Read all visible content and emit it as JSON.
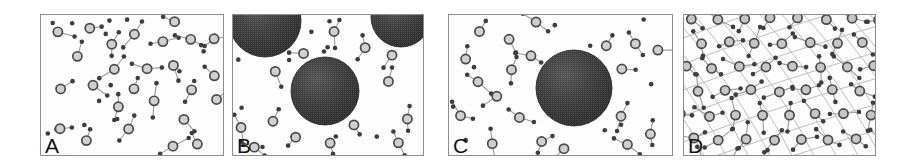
{
  "figure": {
    "type": "scientific-schematic",
    "background_color": "#ffffff",
    "frame_color": "#8d8d8d",
    "width": 907,
    "height": 164,
    "panels": [
      {
        "id": "panel-a",
        "label": "A",
        "x": 40,
        "y": 14,
        "width": 184,
        "height": 142,
        "kind": "amorphous-network",
        "lattice_lines": false,
        "large_spheres": [],
        "atom_color": "#d0d0d0",
        "atom_stroke": "#4a4a4a",
        "dot_color": "#3d3d3d",
        "bond_color": "#9a9a9a",
        "seed": 11,
        "atom_count": 26,
        "dot_count": 52
      },
      {
        "id": "panel-b",
        "label": "B",
        "x": 232,
        "y": 14,
        "width": 192,
        "height": 142,
        "kind": "network-with-nanocrystals",
        "lattice_lines": false,
        "large_spheres": [
          {
            "cx": 32,
            "cy": 6,
            "r": 36
          },
          {
            "cx": 168,
            "cy": 2,
            "r": 30
          },
          {
            "cx": 92,
            "cy": 76,
            "r": 34
          }
        ],
        "atom_color": "#d0d0d0",
        "atom_stroke": "#4a4a4a",
        "dot_color": "#3d3d3d",
        "bond_color": "#9a9a9a",
        "sphere_color": "#3a3a3a",
        "seed": 23,
        "atom_count": 14,
        "dot_count": 30
      },
      {
        "id": "panel-c",
        "label": "C",
        "x": 448,
        "y": 14,
        "width": 225,
        "height": 142,
        "kind": "network-with-single-nanocrystal",
        "lattice_lines": false,
        "large_spheres": [
          {
            "cx": 125,
            "cy": 73,
            "r": 38
          }
        ],
        "atom_color": "#d0d0d0",
        "atom_stroke": "#4a4a4a",
        "dot_color": "#3d3d3d",
        "bond_color": "#9a9a9a",
        "sphere_color": "#3a3a3a",
        "seed": 37,
        "atom_count": 20,
        "dot_count": 42
      },
      {
        "id": "panel-d",
        "label": "D",
        "x": 683,
        "y": 14,
        "width": 193,
        "height": 142,
        "kind": "ordered-crystalline-lattice",
        "lattice_lines": true,
        "lattice_line_color": "#b3b3b3",
        "large_spheres": [],
        "atom_color": "#c6c6c6",
        "atom_stroke": "#4a4a4a",
        "dot_color": "#3d3d3d",
        "bond_color": "#9a9a9a",
        "seed": 59,
        "atom_count": 30,
        "dot_count": 58
      }
    ]
  }
}
